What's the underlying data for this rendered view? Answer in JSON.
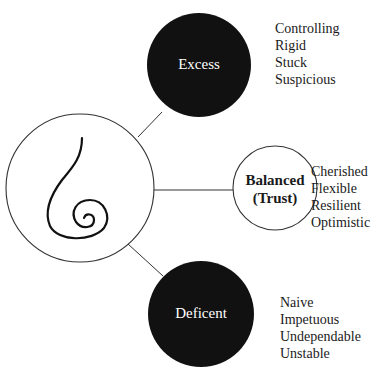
{
  "top_cut_text": "...ed Exploration of Disruptions in Trust Chang...",
  "center": {
    "icon": "spiral-icon"
  },
  "nodes": {
    "excess": {
      "title": "Excess",
      "traits": [
        "Controlling",
        "Rigid",
        "Stuck",
        "Suspicious"
      ]
    },
    "balanced": {
      "title_line1": "Balanced",
      "title_line2": "(Trust)",
      "traits": [
        "Cherished",
        "Flexible",
        "Resilient",
        "Optimistic"
      ]
    },
    "deficient": {
      "title": "Deficent",
      "traits": [
        "Naive",
        "Impetuous",
        "Undependable",
        "Unstable"
      ]
    }
  },
  "colors": {
    "dark_fill": "#111111",
    "stroke": "#333333",
    "text_on_dark": "#ffffff"
  }
}
